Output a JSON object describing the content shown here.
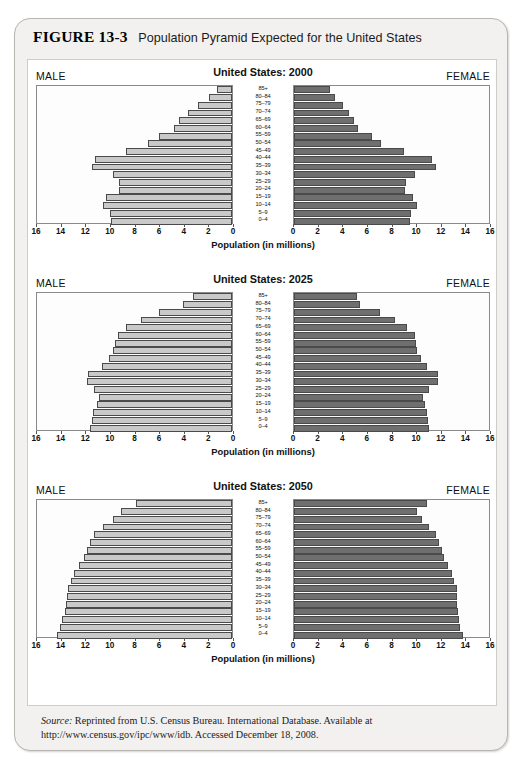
{
  "figure": {
    "number": "FIGURE 13-3",
    "caption": "Population Pyramid Expected for the United States"
  },
  "labels": {
    "male": "MALE",
    "female": "FEMALE",
    "axis_title": "Population (in millions)"
  },
  "axis": {
    "left_ticks": [
      "16",
      "14",
      "12",
      "10",
      "8",
      "6",
      "4",
      "2",
      "0"
    ],
    "right_ticks": [
      "0",
      "2",
      "4",
      "6",
      "8",
      "10",
      "12",
      "14",
      "16"
    ],
    "max": 16,
    "step": 2
  },
  "age_groups": [
    "85+",
    "80–84",
    "75–79",
    "70–74",
    "65–69",
    "60–64",
    "55–59",
    "50–54",
    "45–49",
    "40–44",
    "35–39",
    "30–34",
    "25–29",
    "20–24",
    "15–19",
    "10–14",
    "5–9",
    "0–4"
  ],
  "colors": {
    "male_bar": "#c9c9c9",
    "female_bar": "#6f6f6f",
    "bar_outline": "#4a4a4a",
    "card_background": "#f2f1ef",
    "plate_background": "#ffffff"
  },
  "source": {
    "label": "Source:",
    "text": " Reprinted from U.S. Census Bureau. International Database. Available at http://www.census.gov/ipc/www/idb. Accessed December 18, 2008."
  },
  "chart_data": [
    {
      "type": "bar",
      "title": "United States: 2000",
      "xlabel": "Population (in millions)",
      "ylabel": "",
      "xlim": [
        0,
        16
      ],
      "grid": false,
      "legend": [
        "MALE",
        "FEMALE"
      ],
      "categories": [
        "85+",
        "80–84",
        "75–79",
        "70–74",
        "65–69",
        "60–64",
        "55–59",
        "50–54",
        "45–49",
        "40–44",
        "35–39",
        "30–34",
        "25–29",
        "20–24",
        "15–19",
        "10–14",
        "5–9",
        "0–4"
      ],
      "series": [
        {
          "name": "MALE",
          "values": [
            1.2,
            1.9,
            2.8,
            3.6,
            4.3,
            4.7,
            5.9,
            6.8,
            8.6,
            11.1,
            11.4,
            9.7,
            9.2,
            9.2,
            10.2,
            10.5,
            9.9,
            9.8
          ]
        },
        {
          "name": "FEMALE",
          "values": [
            2.9,
            3.3,
            4.0,
            4.5,
            4.9,
            5.2,
            6.3,
            7.1,
            8.9,
            11.2,
            11.5,
            9.8,
            9.1,
            9.0,
            9.7,
            10.0,
            9.5,
            9.4
          ]
        }
      ]
    },
    {
      "type": "bar",
      "title": "United States: 2025",
      "xlabel": "Population (in millions)",
      "ylabel": "",
      "xlim": [
        0,
        16
      ],
      "grid": false,
      "legend": [
        "MALE",
        "FEMALE"
      ],
      "categories": [
        "85+",
        "80–84",
        "75–79",
        "70–74",
        "65–69",
        "60–64",
        "55–59",
        "50–54",
        "45–49",
        "40–44",
        "35–39",
        "30–34",
        "25–29",
        "20–24",
        "15–19",
        "10–14",
        "5–9",
        "0–4"
      ],
      "series": [
        {
          "name": "MALE",
          "values": [
            3.2,
            4.0,
            5.9,
            7.4,
            8.6,
            9.3,
            9.5,
            9.7,
            10.0,
            10.6,
            11.7,
            11.8,
            11.2,
            10.8,
            11.0,
            11.3,
            11.4,
            11.5
          ]
        },
        {
          "name": "FEMALE",
          "values": [
            5.1,
            5.4,
            7.0,
            8.2,
            9.2,
            9.8,
            9.9,
            10.0,
            10.3,
            10.8,
            11.7,
            11.7,
            11.0,
            10.5,
            10.6,
            10.8,
            10.9,
            11.0
          ]
        }
      ]
    },
    {
      "type": "bar",
      "title": "United States: 2050",
      "xlabel": "Population (in millions)",
      "ylabel": "",
      "xlim": [
        0,
        16
      ],
      "grid": false,
      "legend": [
        "MALE",
        "FEMALE"
      ],
      "categories": [
        "85+",
        "80–84",
        "75–79",
        "70–74",
        "65–69",
        "60–64",
        "55–59",
        "50–54",
        "45–49",
        "40–44",
        "35–39",
        "30–34",
        "25–29",
        "20–24",
        "15–19",
        "10–14",
        "5–9",
        "0–4"
      ],
      "series": [
        {
          "name": "MALE",
          "values": [
            7.8,
            9.0,
            9.7,
            10.5,
            11.2,
            11.5,
            11.8,
            12.0,
            12.4,
            12.8,
            13.1,
            13.3,
            13.4,
            13.5,
            13.6,
            13.8,
            14.0,
            14.2
          ]
        },
        {
          "name": "FEMALE",
          "values": [
            10.8,
            10.0,
            10.4,
            11.0,
            11.5,
            11.8,
            12.0,
            12.2,
            12.5,
            12.8,
            13.0,
            13.2,
            13.2,
            13.2,
            13.3,
            13.4,
            13.5,
            13.7
          ]
        }
      ]
    }
  ]
}
